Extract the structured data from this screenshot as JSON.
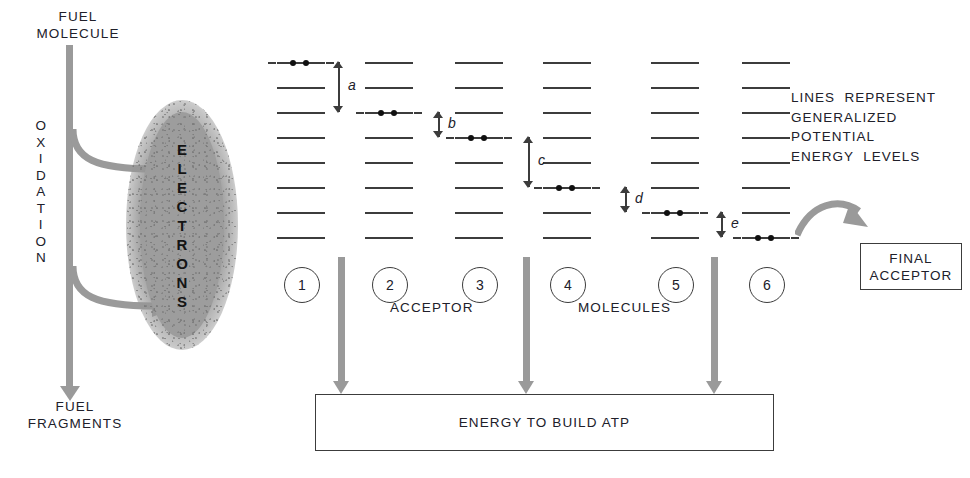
{
  "left_panel": {
    "top_label": "FUEL\nMOLECULE",
    "bottom_label": "FUEL\nFRAGMENTS",
    "vertical_label": "OXIDATION",
    "blob_label": "ELECTRONS",
    "shaft_color": "#9a9a9a",
    "blob_color": "#9d9d9d"
  },
  "ladders": {
    "level_count": 8,
    "line_color": "#3c3c3c",
    "columns": [
      {
        "number": "1",
        "electron_level": 1
      },
      {
        "number": "2",
        "electron_level": 3
      },
      {
        "number": "3",
        "electron_level": 4
      },
      {
        "number": "4",
        "electron_level": 6
      },
      {
        "number": "5",
        "electron_level": 7
      },
      {
        "number": "6",
        "electron_level": 8
      }
    ]
  },
  "gap_labels": [
    {
      "id": "a",
      "label": "a",
      "spans_levels": 2
    },
    {
      "id": "b",
      "label": "b",
      "spans_levels": 1
    },
    {
      "id": "c",
      "label": "c",
      "spans_levels": 2
    },
    {
      "id": "d",
      "label": "d",
      "spans_levels": 1
    },
    {
      "id": "e",
      "label": "e",
      "spans_levels": 1
    }
  ],
  "captions": {
    "acceptor": "ACCEPTOR",
    "molecules": "MOLECULES"
  },
  "legend": {
    "line1": "LINES  REPRESENT",
    "line2": "GENERALIZED",
    "line3": "POTENTIAL",
    "line4": "ENERGY  LEVELS"
  },
  "atp": {
    "label": "ENERGY  TO  BUILD  ATP",
    "arrow_count": 3,
    "arrow_color": "#9a9a9a"
  },
  "final_acceptor": {
    "line1": "FINAL",
    "line2": "ACCEPTOR"
  },
  "chart_data": {
    "type": "diagram",
    "ylabel": "Generalized potential energy levels",
    "level_count": 8,
    "categories": [
      "1",
      "2",
      "3",
      "4",
      "5",
      "6"
    ],
    "series": [
      {
        "name": "electron occupancy level (1 = highest energy, 8 = lowest)",
        "values": [
          1,
          3,
          4,
          6,
          7,
          8
        ]
      }
    ],
    "energy_drops": [
      {
        "label": "a",
        "from_level": 1,
        "to_level": 3,
        "levels": 2
      },
      {
        "label": "b",
        "from_level": 3,
        "to_level": 4,
        "levels": 1
      },
      {
        "label": "c",
        "from_level": 4,
        "to_level": 6,
        "levels": 2
      },
      {
        "label": "d",
        "from_level": 6,
        "to_level": 7,
        "levels": 1
      },
      {
        "label": "e",
        "from_level": 7,
        "to_level": 8,
        "levels": 1
      }
    ],
    "atp_arrows_after_columns": [
      "1",
      "3",
      "5"
    ]
  }
}
